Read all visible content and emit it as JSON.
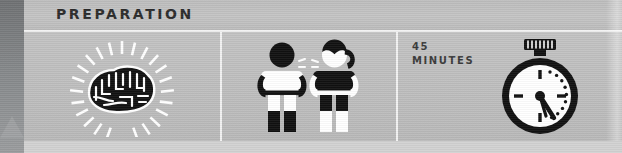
{
  "section": {
    "title": "PREPARATION"
  },
  "panels": [
    {
      "id": "brain",
      "name": "brain-panel",
      "icon": "brain-idea-icon",
      "caption": ""
    },
    {
      "id": "people",
      "name": "people-panel",
      "icon": "two-people-talking-icon",
      "caption": ""
    },
    {
      "id": "time",
      "name": "time-panel",
      "icon": "stopwatch-icon",
      "duration_value": "45",
      "duration_unit": "MINUTES"
    }
  ],
  "colors": {
    "header_bg": "#bdbdbd",
    "panel_bg": "#c0c0c0",
    "divider": "#f2f2f2",
    "ink": "#000000",
    "title_text": "#2b2b2b",
    "spine": "#85888a",
    "below_bg": "#d2d2d2"
  }
}
